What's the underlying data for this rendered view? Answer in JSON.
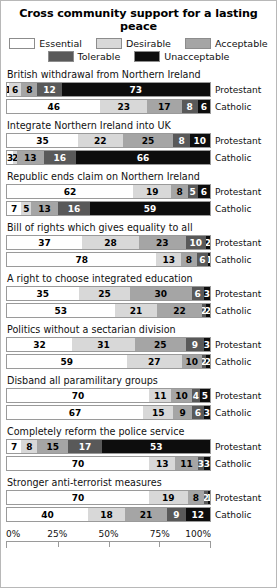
{
  "chart_data": {
    "type": "bar",
    "title": "Cross community support for a lasting peace",
    "subtype": "100% stacked horizontal bar, grouped by statement and community",
    "xlabel": "",
    "ylabel": "",
    "xlim": [
      0,
      100
    ],
    "grid": false,
    "legend_position": "top",
    "tick_labels": [
      "0%",
      "25%",
      "50%",
      "75%",
      "100%"
    ],
    "tick_values": [
      0,
      25,
      50,
      75,
      100
    ],
    "legend": [
      "Essential",
      "Desirable",
      "Acceptable",
      "Tolerable",
      "Unacceptable"
    ],
    "series_colors": [
      "#ffffff",
      "#d8d8d8",
      "#a5a5a5",
      "#595959",
      "#0d0d0d"
    ],
    "row_labels": [
      "Protestant",
      "Catholic"
    ],
    "categories": [
      "British withdrawal from Northern Ireland",
      "Integrate Northern Ireland into UK",
      "Republic ends claim on Northern Ireland",
      "Bill of rights which gives equality to all",
      "A right to choose integrated education",
      "Politics without a sectarian division",
      "Disband all paramilitary groups",
      "Completely reform the police service",
      "Stronger anti-terrorist measures"
    ],
    "groups": [
      {
        "label": "British withdrawal from Northern Ireland",
        "rows": [
          {
            "label": "Protestant",
            "values": [
              1,
              6,
              8,
              12,
              73
            ]
          },
          {
            "label": "Catholic",
            "values": [
              46,
              23,
              17,
              8,
              6
            ]
          }
        ]
      },
      {
        "label": "Integrate Northern Ireland into UK",
        "rows": [
          {
            "label": "Protestant",
            "values": [
              35,
              22,
              25,
              8,
              10
            ]
          },
          {
            "label": "Catholic",
            "values": [
              3,
              2,
              13,
              16,
              66
            ]
          }
        ]
      },
      {
        "label": "Republic ends claim on Northern Ireland",
        "rows": [
          {
            "label": "Protestant",
            "values": [
              62,
              19,
              8,
              5,
              6
            ]
          },
          {
            "label": "Catholic",
            "values": [
              7,
              5,
              13,
              16,
              59
            ]
          }
        ]
      },
      {
        "label": "Bill of rights which gives equality to all",
        "rows": [
          {
            "label": "Protestant",
            "values": [
              37,
              28,
              23,
              10,
              2
            ]
          },
          {
            "label": "Catholic",
            "values": [
              78,
              13,
              8,
              6,
              1
            ]
          }
        ]
      },
      {
        "label": "A right to choose integrated education",
        "rows": [
          {
            "label": "Protestant",
            "values": [
              35,
              25,
              30,
              6,
              3
            ]
          },
          {
            "label": "Catholic",
            "values": [
              53,
              21,
              22,
              2,
              2
            ]
          }
        ]
      },
      {
        "label": "Politics without a sectarian division",
        "rows": [
          {
            "label": "Protestant",
            "values": [
              32,
              31,
              25,
              9,
              3
            ]
          },
          {
            "label": "Catholic",
            "values": [
              59,
              27,
              10,
              2,
              2
            ]
          }
        ]
      },
      {
        "label": "Disband all paramilitary groups",
        "rows": [
          {
            "label": "Protestant",
            "values": [
              70,
              11,
              10,
              4,
              5
            ]
          },
          {
            "label": "Catholic",
            "values": [
              67,
              15,
              9,
              6,
              3
            ]
          }
        ]
      },
      {
        "label": "Completely reform the police service",
        "rows": [
          {
            "label": "Protestant",
            "values": [
              7,
              8,
              15,
              17,
              53
            ]
          },
          {
            "label": "Catholic",
            "values": [
              70,
              13,
              11,
              3,
              3
            ]
          }
        ]
      },
      {
        "label": "Stronger anti-terrorist measures",
        "rows": [
          {
            "label": "Protestant",
            "values": [
              70,
              19,
              8,
              2,
              1
            ]
          },
          {
            "label": "Catholic",
            "values": [
              40,
              18,
              21,
              9,
              12
            ]
          }
        ]
      }
    ]
  }
}
